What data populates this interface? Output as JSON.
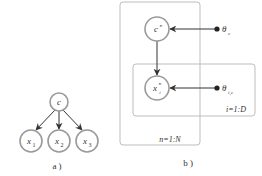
{
  "figure": {
    "panel_a": {
      "caption": "a )",
      "nodes": [
        {
          "id": "c",
          "label": "c",
          "sub": ""
        },
        {
          "id": "x1",
          "label": "x",
          "sub": "1"
        },
        {
          "id": "x2",
          "label": "x",
          "sub": "2"
        },
        {
          "id": "x3",
          "label": "x",
          "sub": "3"
        }
      ],
      "edges": [
        [
          "c",
          "x1"
        ],
        [
          "c",
          "x2"
        ],
        [
          "c",
          "x3"
        ]
      ]
    },
    "panel_b": {
      "caption": "b )",
      "nodes": [
        {
          "id": "cn",
          "label": "c",
          "sup": "n"
        },
        {
          "id": "xin",
          "label": "x",
          "sub": "i",
          "sup": "n"
        }
      ],
      "parameters": [
        {
          "id": "theta_c",
          "label": "θ",
          "sub": "c"
        },
        {
          "id": "theta_ic",
          "label": "θ",
          "sub": "i,c"
        }
      ],
      "plates": [
        {
          "id": "outer",
          "label": "n=1:N"
        },
        {
          "id": "inner",
          "label": "i=1:D"
        }
      ],
      "edges": [
        [
          "cn",
          "xin"
        ],
        [
          "theta_c",
          "cn"
        ],
        [
          "theta_ic",
          "xin"
        ]
      ]
    }
  }
}
